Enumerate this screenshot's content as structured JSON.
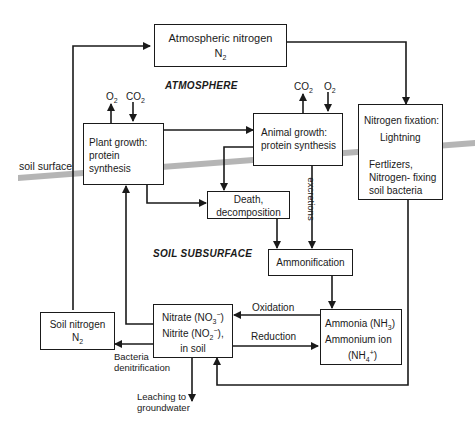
{
  "diagram": {
    "regions": {
      "atmosphere": "ATMOSPHERE",
      "soil_subsurface": "SOIL SUBSURFACE",
      "soil_surface": "soil surface"
    },
    "nodes": {
      "atmospheric_nitrogen": {
        "line1": "Atmospheric nitrogen",
        "formula_base": "N",
        "formula_sub": "2"
      },
      "plant_growth": {
        "line1": "Plant growth:",
        "line2": "protein synthesis"
      },
      "animal_growth": {
        "line1": "Animal growth:",
        "line2": "protein synthesis"
      },
      "nitrogen_fixation": {
        "line1": "Nitrogen fixation:",
        "line2": "Lightning",
        "line3": "Fertlizers,",
        "line4": "Nitrogen- fixing",
        "line5": "soil bacteria"
      },
      "death_decomposition": {
        "line1": "Death,",
        "line2": "decomposition"
      },
      "ammonification": {
        "line1": "Ammonification"
      },
      "soil_nitrogen": {
        "line1": "Soil nitrogen",
        "formula_base": "N",
        "formula_sub": "2"
      },
      "nitrate_nitrite": {
        "nitrate": "Nitrate (NO",
        "nitrate_sub": "3",
        "nitrate_sup": "−",
        "nitrite": "Nitrite (NO",
        "nitrite_sub": "2",
        "nitrite_sup": "−",
        "line3": "in soil"
      },
      "ammonia": {
        "line1": "Ammonia (NH",
        "line1_sub": "3",
        "line2": "Ammonium ion",
        "line3_base": "(NH",
        "line3_sub": "4",
        "line3_sup": "+"
      }
    },
    "gases": {
      "plant_o2": {
        "base": "O",
        "sub": "2"
      },
      "plant_co2": {
        "base": "CO",
        "sub": "2"
      },
      "animal_co2": {
        "base": "CO",
        "sub": "2"
      },
      "animal_o2": {
        "base": "O",
        "sub": "2"
      }
    },
    "edge_labels": {
      "excretions": "excretions",
      "oxidation": "Oxidation",
      "reduction": "Reduction",
      "bacteria_denitrification_1": "Bacteria",
      "bacteria_denitrification_2": "denitrification",
      "leaching_1": "Leaching to",
      "leaching_2": "groundwater"
    },
    "colors": {
      "line": "#1a1a1a",
      "soil_band": "#a8a8a8"
    }
  }
}
